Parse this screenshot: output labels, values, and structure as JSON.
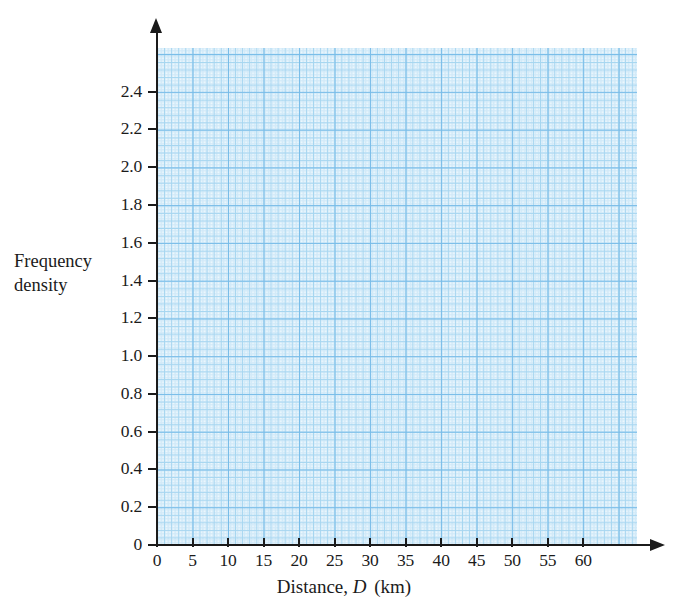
{
  "chart_data": {
    "type": "bar",
    "title": "",
    "subtitle": "",
    "xlabel_prefix": "Distance,",
    "xlabel_variable": "D",
    "xlabel_unit": "(km)",
    "ylabel_line1": "Frequency",
    "ylabel_line2": "density",
    "x_tick_labels": [
      "0",
      "5",
      "10",
      "15",
      "20",
      "25",
      "30",
      "35",
      "40",
      "45",
      "50",
      "55",
      "60"
    ],
    "x_tick_values": [
      0,
      5,
      10,
      15,
      20,
      25,
      30,
      35,
      40,
      45,
      50,
      55,
      60
    ],
    "y_tick_labels": [
      "0",
      "0.2",
      "0.4",
      "0.6",
      "0.8",
      "1.0",
      "1.2",
      "1.4",
      "1.6",
      "1.8",
      "2.0",
      "2.2",
      "2.4"
    ],
    "y_tick_values": [
      0,
      0.2,
      0.4,
      0.6,
      0.8,
      1.0,
      1.2,
      1.4,
      1.6,
      1.8,
      2.0,
      2.2,
      2.4
    ],
    "xlim": [
      0,
      67.5
    ],
    "ylim": [
      0,
      2.63
    ],
    "grid": true,
    "grid_type": "graph-paper",
    "grid_major_x_step": 5,
    "grid_major_y_step": 0.2,
    "grid_minor_subdivisions": 5,
    "legend": null,
    "categories": [],
    "values": [],
    "series": [],
    "annotations": [],
    "note": "Blank graph-paper axes with no plotted data"
  },
  "colors": {
    "grid_major": "#74b9e7",
    "grid_medium": "#a8d6f0",
    "grid_fine": "#d8ecf9",
    "grid_background": "#fbfeff",
    "axis": "#1b1b1b",
    "text": "#1b1b1b",
    "page_background": "#ffffff"
  }
}
